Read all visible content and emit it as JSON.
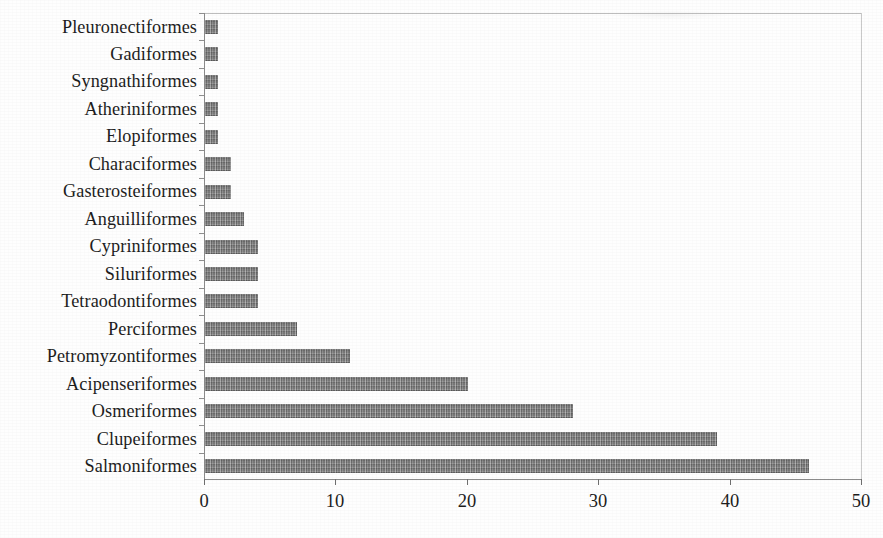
{
  "chart_data": {
    "type": "bar",
    "orientation": "horizontal",
    "title": "",
    "subtitle": "",
    "xlabel": "",
    "ylabel": "",
    "xlim": [
      0,
      50
    ],
    "xticks": [
      "0",
      "10",
      "20",
      "30",
      "40",
      "50"
    ],
    "xtick_values": [
      0,
      10,
      20,
      30,
      40,
      50
    ],
    "grid": false,
    "legend": null,
    "legend_position": "none",
    "series_name": "",
    "bar_color": "#848484",
    "axis_color": "#8b8b8b",
    "text_color": "#1d1d1d",
    "categories": [
      "Pleuronectiformes",
      "Gadiformes",
      "Syngnathiformes",
      "Atheriniformes",
      "Elopiformes",
      "Characiformes",
      "Gasterosteiformes",
      "Anguilliformes",
      "Cypriniformes",
      "Siluriformes",
      "Tetraodontiformes",
      "Perciformes",
      "Petromyzontiformes",
      "Acipenseriformes",
      "Osmeriformes",
      "Clupeiformes",
      "Salmoniformes"
    ],
    "values": [
      1,
      1,
      1,
      1,
      1,
      2,
      2,
      3,
      4,
      4,
      4,
      7,
      11,
      20,
      28,
      39,
      46
    ],
    "bars": [
      {
        "category": "Pleuronectiformes",
        "value": 1
      },
      {
        "category": "Gadiformes",
        "value": 1
      },
      {
        "category": "Syngnathiformes",
        "value": 1
      },
      {
        "category": "Atheriniformes",
        "value": 1
      },
      {
        "category": "Elopiformes",
        "value": 1
      },
      {
        "category": "Characiformes",
        "value": 2
      },
      {
        "category": "Gasterosteiformes",
        "value": 2
      },
      {
        "category": "Anguilliformes",
        "value": 3
      },
      {
        "category": "Cypriniformes",
        "value": 4
      },
      {
        "category": "Siluriformes",
        "value": 4
      },
      {
        "category": "Tetraodontiformes",
        "value": 4
      },
      {
        "category": "Perciformes",
        "value": 7
      },
      {
        "category": "Petromyzontiformes",
        "value": 11
      },
      {
        "category": "Acipenseriformes",
        "value": 20
      },
      {
        "category": "Osmeriformes",
        "value": 28
      },
      {
        "category": "Clupeiformes",
        "value": 39
      },
      {
        "category": "Salmoniformes",
        "value": 46
      }
    ]
  }
}
